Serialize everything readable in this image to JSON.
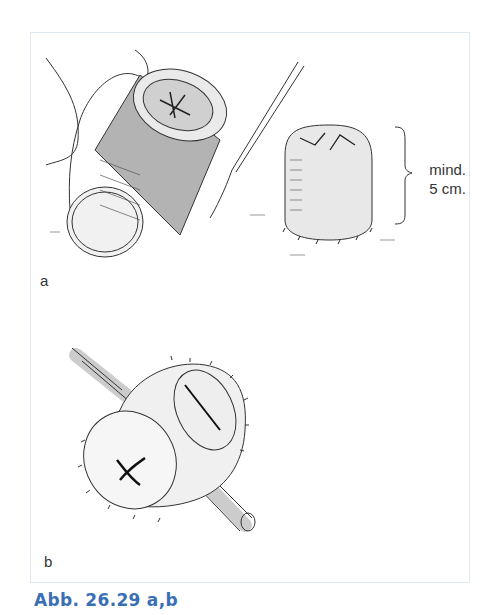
{
  "figure": {
    "caption": "Abb. 26.29 a,b",
    "caption_color": "#3a6fb5",
    "panels": [
      {
        "label": "a",
        "description": "stoma-construction-illustration-a"
      },
      {
        "label": "b",
        "description": "loop-stoma-over-rod-illustration-b"
      }
    ],
    "measurement": {
      "line1": "mind.",
      "line2": "5 cm."
    }
  }
}
